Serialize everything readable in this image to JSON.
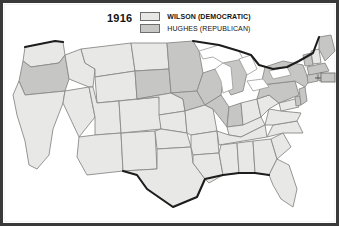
{
  "figure": {
    "kind": "electoral-map",
    "frame_color": "#3a3a3a",
    "background": "#ffffff"
  },
  "legend": {
    "year": "1916",
    "entries": [
      {
        "label": "WILSON (DEMOCRATIC)",
        "color": "#e7e7e5",
        "emphasis": "bold"
      },
      {
        "label": "HUGHES (REPUBLICAN)",
        "color": "#c8c8c6",
        "emphasis": "normal"
      }
    ]
  },
  "map": {
    "region": "United States",
    "wilson_fill": "#e8e8e6",
    "hughes_fill": "#c6c6c4",
    "water_fill": "#ffffff",
    "border_color": "#8a8a88",
    "states": [
      {
        "code": "WA",
        "winner": "wilson"
      },
      {
        "code": "OR",
        "winner": "hughes"
      },
      {
        "code": "CA",
        "winner": "wilson"
      },
      {
        "code": "NV",
        "winner": "wilson"
      },
      {
        "code": "ID",
        "winner": "wilson"
      },
      {
        "code": "MT",
        "winner": "wilson"
      },
      {
        "code": "WY",
        "winner": "wilson"
      },
      {
        "code": "UT",
        "winner": "wilson"
      },
      {
        "code": "AZ",
        "winner": "wilson"
      },
      {
        "code": "NM",
        "winner": "wilson"
      },
      {
        "code": "CO",
        "winner": "wilson"
      },
      {
        "code": "ND",
        "winner": "wilson"
      },
      {
        "code": "SD",
        "winner": "hughes"
      },
      {
        "code": "NE",
        "winner": "wilson"
      },
      {
        "code": "KS",
        "winner": "wilson"
      },
      {
        "code": "OK",
        "winner": "wilson"
      },
      {
        "code": "TX",
        "winner": "wilson"
      },
      {
        "code": "MN",
        "winner": "hughes"
      },
      {
        "code": "IA",
        "winner": "hughes"
      },
      {
        "code": "MO",
        "winner": "wilson"
      },
      {
        "code": "AR",
        "winner": "wilson"
      },
      {
        "code": "LA",
        "winner": "wilson"
      },
      {
        "code": "WI",
        "winner": "hughes"
      },
      {
        "code": "IL",
        "winner": "hughes"
      },
      {
        "code": "MI",
        "winner": "hughes"
      },
      {
        "code": "IN",
        "winner": "hughes"
      },
      {
        "code": "OH",
        "winner": "wilson"
      },
      {
        "code": "KY",
        "winner": "wilson"
      },
      {
        "code": "TN",
        "winner": "wilson"
      },
      {
        "code": "MS",
        "winner": "wilson"
      },
      {
        "code": "AL",
        "winner": "wilson"
      },
      {
        "code": "GA",
        "winner": "wilson"
      },
      {
        "code": "FL",
        "winner": "wilson"
      },
      {
        "code": "SC",
        "winner": "wilson"
      },
      {
        "code": "NC",
        "winner": "wilson"
      },
      {
        "code": "VA",
        "winner": "wilson"
      },
      {
        "code": "WV",
        "winner": "wilson"
      },
      {
        "code": "MD",
        "winner": "wilson"
      },
      {
        "code": "DE",
        "winner": "hughes"
      },
      {
        "code": "PA",
        "winner": "hughes"
      },
      {
        "code": "NJ",
        "winner": "hughes"
      },
      {
        "code": "NY",
        "winner": "hughes"
      },
      {
        "code": "CT",
        "winner": "hughes"
      },
      {
        "code": "RI",
        "winner": "hughes"
      },
      {
        "code": "MA",
        "winner": "hughes"
      },
      {
        "code": "VT",
        "winner": "hughes"
      },
      {
        "code": "NH",
        "winner": "wilson"
      },
      {
        "code": "ME",
        "winner": "hughes"
      }
    ],
    "inset": {
      "present": true,
      "winner": "hughes"
    }
  }
}
